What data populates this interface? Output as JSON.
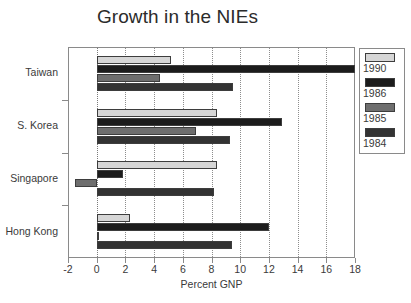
{
  "chart_data": {
    "type": "bar",
    "orientation": "horizontal",
    "title": "Growth in the NIEs",
    "xlabel": "Percent GNP",
    "ylabel": "",
    "xlim": [
      -2,
      18
    ],
    "xticks": [
      -2,
      0,
      2,
      4,
      6,
      8,
      10,
      12,
      14,
      16,
      18
    ],
    "xtick_labels": [
      "-2",
      "0",
      "2",
      "4",
      "6",
      "8",
      "10",
      "12",
      "14",
      "16",
      "18"
    ],
    "grid": "vertical-dotted",
    "legend_position": "right",
    "categories": [
      "Taiwan",
      "S. Korea",
      "Singapore",
      "Hong Kong"
    ],
    "series": [
      {
        "name": "1990",
        "color": "#d6d6d6",
        "values": [
          5.2,
          8.4,
          8.4,
          2.3
        ]
      },
      {
        "name": "1986",
        "color": "#1c1c1c",
        "values": [
          18.0,
          12.9,
          1.8,
          12.0
        ]
      },
      {
        "name": "1985",
        "color": "#6e6e6e",
        "values": [
          4.4,
          6.9,
          -1.5,
          0.1
        ]
      },
      {
        "name": "1984",
        "color": "#333333",
        "values": [
          9.5,
          9.3,
          8.2,
          9.4
        ]
      }
    ]
  },
  "legend": {
    "entries": [
      {
        "label": "1990",
        "color": "#d6d6d6"
      },
      {
        "label": "1986",
        "color": "#1c1c1c"
      },
      {
        "label": "1985",
        "color": "#6e6e6e"
      },
      {
        "label": "1984",
        "color": "#333333"
      }
    ]
  },
  "colors": {
    "background": "#ffffff",
    "axis": "#8a8a8a",
    "text": "#3a3a3a",
    "title": "#2b2b2b",
    "grid": "#8d8d8d",
    "bar_outline": "#3d3d3d"
  }
}
